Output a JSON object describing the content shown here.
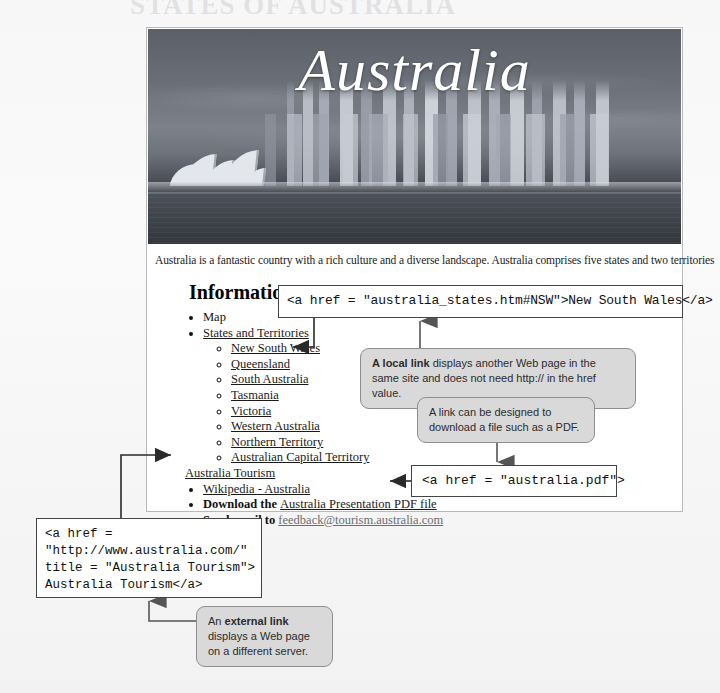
{
  "background": {
    "ghost_heading": "STATES OF AUSTRALIA"
  },
  "page": {
    "hero_title": "Australia",
    "intro": "Australia is a fantastic country with a rich culture and a diverse landscape. Australia comprises five states and two territories",
    "info_heading": "Information",
    "list": {
      "map": "Map",
      "states_and_territories": "States and Territories",
      "states": [
        "New South Wales",
        "Queensland",
        "South Australia",
        "Tasmania",
        "Victoria",
        "Western Australia",
        "Northern Territory",
        "Australian Capital Territory"
      ],
      "australia_tourism": "Australia Tourism",
      "wikipedia": "Wikipedia - Australia",
      "download_prefix": "Download the ",
      "download_link": "Australia Presentation PDF file",
      "email_prefix": "Send email to ",
      "email_link": "feedback@tourism.australia.com"
    }
  },
  "code_boxes": {
    "nsw": "<a href = \"australia_states.htm#NSW\">New South Wales</a>",
    "pdf": "<a href = \"australia.pdf\">",
    "tourism": "<a href =\n\"http://www.australia.com/\"\ntitle = \"Australia Tourism\">\nAustralia Tourism</a>"
  },
  "annotations": {
    "local_link": {
      "bold": "A local link",
      "rest": " displays another Web page in the same site and does not need http:// in the href value."
    },
    "pdf_link": {
      "line1": "A link can be designed to",
      "line2": "download a file such as a PDF."
    },
    "external_link": {
      "prefix": "An ",
      "bold": "external link",
      "rest": " displays a Web page on a different server."
    }
  },
  "colors": {
    "bubble_bg": "#d9d9d9",
    "bubble_border": "#8e8e8e",
    "code_border": "#444444",
    "connector": "#555555",
    "page_bg": "#ffffff",
    "canvas_bg": "#f4f4f4"
  }
}
